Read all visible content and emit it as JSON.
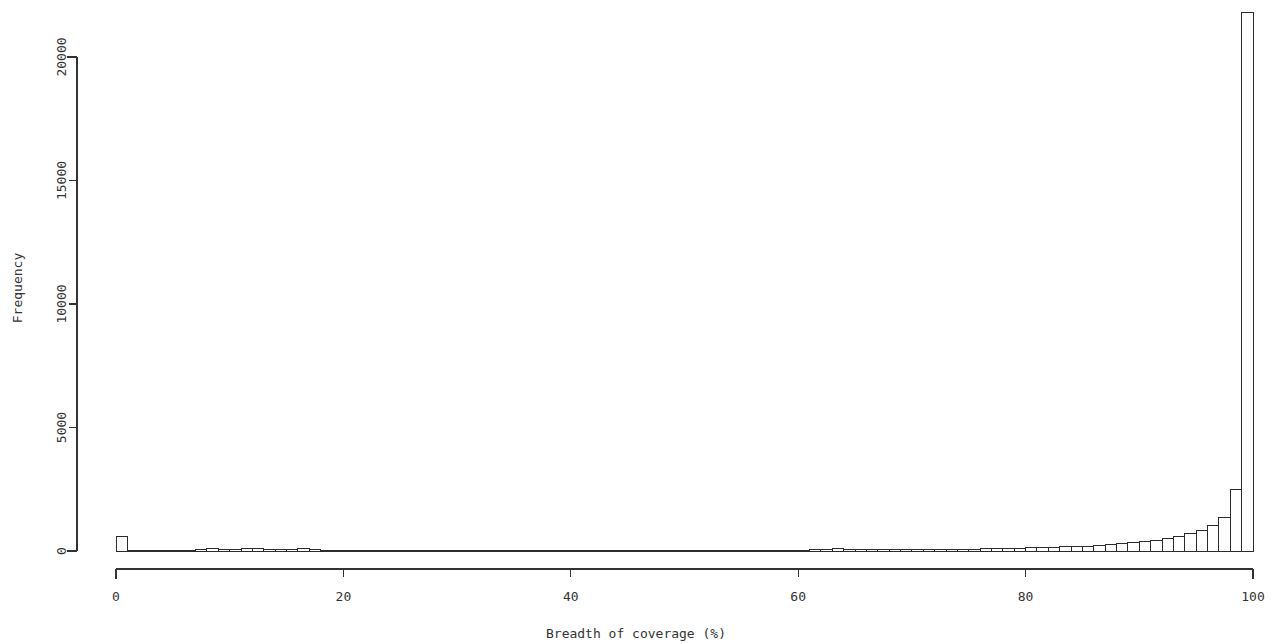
{
  "chart_data": {
    "type": "bar",
    "title": "",
    "subtitle": "",
    "xlabel": "Breadth of coverage (%)",
    "ylabel": "Frequency",
    "xlim": [
      0,
      100
    ],
    "ylim": [
      0,
      22000
    ],
    "grid": false,
    "legend": null,
    "bin_width": 1,
    "x_ticks": [
      0,
      20,
      40,
      60,
      80,
      100
    ],
    "x_tick_labels": [
      "0",
      "20",
      "40",
      "60",
      "80",
      "100"
    ],
    "y_ticks": [
      0,
      5000,
      10000,
      15000,
      20000
    ],
    "y_tick_labels": [
      "0",
      "5000",
      "10000",
      "15000",
      "20000"
    ],
    "bin_starts": [
      0,
      1,
      2,
      3,
      4,
      5,
      6,
      7,
      8,
      9,
      10,
      11,
      12,
      13,
      14,
      15,
      16,
      17,
      18,
      19,
      20,
      21,
      22,
      23,
      24,
      25,
      26,
      27,
      28,
      29,
      30,
      31,
      32,
      33,
      34,
      35,
      36,
      37,
      38,
      39,
      40,
      41,
      42,
      43,
      44,
      45,
      46,
      47,
      48,
      49,
      50,
      51,
      52,
      53,
      54,
      55,
      56,
      57,
      58,
      59,
      60,
      61,
      62,
      63,
      64,
      65,
      66,
      67,
      68,
      69,
      70,
      71,
      72,
      73,
      74,
      75,
      76,
      77,
      78,
      79,
      80,
      81,
      82,
      83,
      84,
      85,
      86,
      87,
      88,
      89,
      90,
      91,
      92,
      93,
      94,
      95,
      96,
      97,
      98,
      99
    ],
    "values": [
      570,
      30,
      20,
      20,
      25,
      30,
      35,
      60,
      90,
      80,
      70,
      85,
      95,
      80,
      60,
      50,
      90,
      45,
      30,
      25,
      20,
      20,
      18,
      15,
      15,
      12,
      12,
      10,
      10,
      10,
      10,
      10,
      10,
      10,
      10,
      10,
      10,
      10,
      10,
      10,
      10,
      10,
      10,
      10,
      10,
      10,
      10,
      10,
      10,
      10,
      10,
      10,
      10,
      10,
      10,
      12,
      12,
      15,
      15,
      18,
      20,
      55,
      80,
      85,
      70,
      65,
      70,
      75,
      70,
      70,
      75,
      70,
      70,
      75,
      80,
      80,
      85,
      110,
      100,
      105,
      130,
      140,
      150,
      170,
      185,
      200,
      230,
      260,
      290,
      330,
      380,
      440,
      520,
      600,
      700,
      830,
      1030,
      1340,
      1870,
      2480
    ],
    "peak_value": 21820,
    "peak_bin_start": 99
  },
  "figure": {
    "background_color": "#ffffff",
    "line_color": "#2b2b2b",
    "text_color": "#333333"
  }
}
